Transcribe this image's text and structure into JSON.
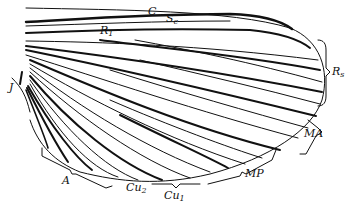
{
  "figure": {
    "labels": {
      "costa": {
        "main": "C",
        "sub": ""
      },
      "subcosta": {
        "main": "S",
        "sub": "c"
      },
      "radius1": {
        "main": "R",
        "sub": "1"
      },
      "radial_sector": {
        "main": "R",
        "sub": "s"
      },
      "media_anterior": {
        "main": "MA",
        "sub": ""
      },
      "media_posterior": {
        "main": "MP",
        "sub": ""
      },
      "cubitus1": {
        "main": "Cu",
        "sub": "1"
      },
      "cubitus2": {
        "main": "Cu",
        "sub": "2"
      },
      "anal": {
        "main": "A",
        "sub": ""
      },
      "jugal": {
        "main": "J",
        "sub": ""
      }
    },
    "colors": {
      "ink": "#111111",
      "background": "#ffffff"
    }
  }
}
